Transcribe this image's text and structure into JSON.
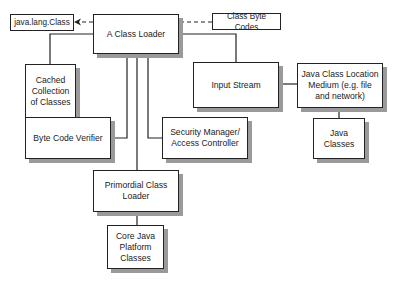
{
  "diagram": {
    "nodes": {
      "java_lang_class": "java.lang.Class",
      "class_loader": "A Class Loader",
      "class_byte_codes": "Class Byte Codes",
      "cached_collection": "Cached Collection of Classes",
      "input_stream": "Input Stream",
      "location_medium": "Java Class Location Medium (e.g. file and network)",
      "byte_code_verifier": "Byte Code Verifier",
      "security_manager": "Security Manager/ Access Controller",
      "java_classes": "Java Classes",
      "primordial_loader": "Primordial Class Loader",
      "core_classes": "Core Java Platform Classes"
    },
    "edges": [
      {
        "from": "class_byte_codes",
        "to": "java_lang_class",
        "style": "dashed-arrow",
        "via": "class_loader"
      },
      {
        "from": "class_loader",
        "to": "cached_collection"
      },
      {
        "from": "class_loader",
        "to": "input_stream"
      },
      {
        "from": "input_stream",
        "to": "location_medium"
      },
      {
        "from": "location_medium",
        "to": "java_classes"
      },
      {
        "from": "class_loader",
        "to": "byte_code_verifier"
      },
      {
        "from": "class_loader",
        "to": "security_manager"
      },
      {
        "from": "class_loader",
        "to": "primordial_loader"
      },
      {
        "from": "primordial_loader",
        "to": "core_classes"
      }
    ],
    "colors": {
      "line": "#222222",
      "shadow": "#9a9a9a",
      "background": "#ffffff"
    }
  }
}
